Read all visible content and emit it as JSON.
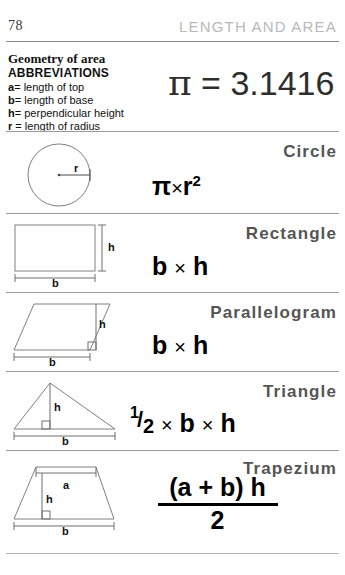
{
  "header": {
    "page_number": "78",
    "running_head": "LENGTH AND AREA"
  },
  "abbreviations": {
    "title": "Geometry of area",
    "subtitle": "ABBREVIATIONS",
    "items": [
      {
        "symbol": "a",
        "eq": "=",
        "definition": "length of top"
      },
      {
        "symbol": "b",
        "eq": "=",
        "definition": "length of base"
      },
      {
        "symbol": "h",
        "eq": "=",
        "definition": "perpendicular height"
      },
      {
        "symbol": "r",
        "eq": "=",
        "definition": "length of radius"
      }
    ]
  },
  "pi": {
    "symbol": "π",
    "equals_value": " = 3.1416"
  },
  "sections": [
    {
      "name": "circle",
      "title": "Circle",
      "formula_parts": {
        "a": "π",
        "op": "×",
        "b": "r",
        "sup": "2"
      },
      "diagram_labels": {
        "r": "r"
      }
    },
    {
      "name": "rectangle",
      "title": "Rectangle",
      "formula_parts": {
        "a": "b",
        "op": "×",
        "b": "h"
      },
      "diagram_labels": {
        "h": "h",
        "b": "b"
      }
    },
    {
      "name": "parallelogram",
      "title": "Parallelogram",
      "formula_parts": {
        "a": "b",
        "op": "×",
        "b": "h"
      },
      "diagram_labels": {
        "h": "h",
        "b": "b"
      }
    },
    {
      "name": "triangle",
      "title": "Triangle",
      "formula_parts": {
        "num": "1",
        "slash": "/",
        "den": "2",
        "op1": "×",
        "a": "b",
        "op2": "×",
        "b": "h"
      },
      "diagram_labels": {
        "h": "h",
        "b": "b"
      }
    },
    {
      "name": "trapezium",
      "title": "Trapezium",
      "formula_parts": {
        "numerator": "(a + b) h",
        "denominator": "2"
      },
      "diagram_labels": {
        "a": "a",
        "h": "h",
        "b": "b"
      }
    }
  ],
  "colors": {
    "rule": "#9a9a9a",
    "running_head": "#b9b9b9",
    "section_title": "#555555",
    "diagram_stroke": "#777777",
    "text": "#111111"
  }
}
